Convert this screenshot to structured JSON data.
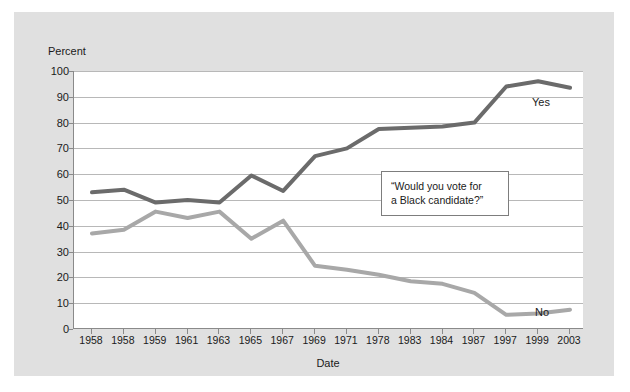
{
  "chart_data": {
    "type": "line",
    "title": "",
    "xlabel": "Date",
    "ylabel": "Percent",
    "ylim": [
      0,
      100
    ],
    "ytick_step": 10,
    "yticks": [
      0,
      10,
      20,
      30,
      40,
      50,
      60,
      70,
      80,
      90,
      100
    ],
    "grid": true,
    "legend_position": "inline-right-end-labels",
    "categories": [
      "1958",
      "1958",
      "1959",
      "1961",
      "1963",
      "1965",
      "1967",
      "1969",
      "1971",
      "1978",
      "1983",
      "1984",
      "1987",
      "1997",
      "1999",
      "2003"
    ],
    "series": [
      {
        "name": "Yes",
        "color": "#6b6b6b",
        "values": [
          53,
          54,
          49,
          50,
          49,
          59.5,
          53.5,
          67,
          70,
          77.5,
          78,
          78.5,
          80,
          94,
          96,
          93.5
        ]
      },
      {
        "name": "No",
        "color": "#a8a8a8",
        "values": [
          37,
          38.5,
          45.5,
          43,
          45.5,
          35,
          42,
          24.5,
          23,
          21,
          18.5,
          17.5,
          14,
          5.5,
          6,
          7.5
        ]
      }
    ],
    "annotations": [
      {
        "id": "survey-question",
        "line1": "“Would you vote for",
        "line2": "a Black candidate?”"
      }
    ]
  },
  "figure": {
    "panel_background": "#e0e0e0",
    "plot_background": "#ffffff",
    "gridline_color": "#b8b8b8",
    "axis_color": "#8a8a8a",
    "text_color": "#1a1a1a"
  }
}
